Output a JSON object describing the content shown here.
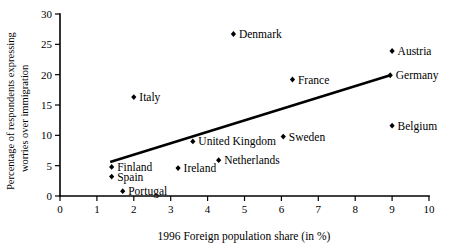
{
  "chart_data": {
    "type": "scatter",
    "title": "",
    "xlabel": "1996 Foreign population share (in %)",
    "ylabel_line1": "Percentage of respondents expressing",
    "ylabel_line2": "worries over immigration",
    "xlim": [
      0,
      10
    ],
    "ylim": [
      0,
      30
    ],
    "xticks": [
      "0",
      "1",
      "2",
      "3",
      "4",
      "5",
      "6",
      "7",
      "8",
      "9",
      "10"
    ],
    "xtick_values": [
      0,
      1,
      2,
      3,
      4,
      5,
      6,
      7,
      8,
      9,
      10
    ],
    "yticks": [
      "0",
      "5",
      "10",
      "15",
      "20",
      "25",
      "30"
    ],
    "ytick_values": [
      0,
      5,
      10,
      15,
      20,
      25,
      30
    ],
    "grid": false,
    "legend": "none",
    "marker_color": "#000000",
    "line_color": "#000000",
    "points": [
      {
        "label": "Finland",
        "x": 1.4,
        "y": 4.8,
        "label_pos": "right"
      },
      {
        "label": "Spain",
        "x": 1.4,
        "y": 3.2,
        "label_pos": "right"
      },
      {
        "label": "Portugal",
        "x": 1.7,
        "y": 0.8,
        "label_pos": "right"
      },
      {
        "label": "Italy",
        "x": 2.0,
        "y": 16.3,
        "label_pos": "right"
      },
      {
        "label": "Ireland",
        "x": 3.2,
        "y": 4.6,
        "label_pos": "right"
      },
      {
        "label": "United Kingdom",
        "x": 3.6,
        "y": 9.0,
        "label_pos": "right"
      },
      {
        "label": "Netherlands",
        "x": 4.3,
        "y": 5.9,
        "label_pos": "right"
      },
      {
        "label": "Denmark",
        "x": 4.7,
        "y": 26.7,
        "label_pos": "right"
      },
      {
        "label": "Sweden",
        "x": 6.05,
        "y": 9.8,
        "label_pos": "right"
      },
      {
        "label": "France",
        "x": 6.3,
        "y": 19.2,
        "label_pos": "right"
      },
      {
        "label": "Belgium",
        "x": 9.0,
        "y": 11.6,
        "label_pos": "right"
      },
      {
        "label": "Austria",
        "x": 9.0,
        "y": 23.9,
        "label_pos": "right"
      },
      {
        "label": "Germany",
        "x": 8.95,
        "y": 19.9,
        "label_pos": "right"
      }
    ],
    "trend_line": {
      "name": "fitted regression line",
      "x_start": 1.36,
      "y_start": 5.6,
      "x_end": 8.95,
      "y_end": 19.9
    }
  }
}
